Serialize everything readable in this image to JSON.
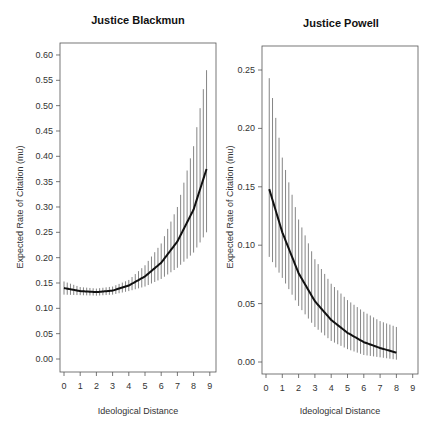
{
  "chart_data": [
    {
      "type": "line",
      "title": "Justice Blackmun",
      "xlabel": "Ideological Distance",
      "ylabel": "Expected Rate of Citation (mu)",
      "xlim": [
        0,
        9
      ],
      "ylim": [
        0.0,
        0.6
      ],
      "xticks": [
        0,
        1,
        2,
        3,
        4,
        5,
        6,
        7,
        8,
        9
      ],
      "yticks": [
        "0.00",
        "0.05",
        "0.10",
        "0.15",
        "0.20",
        "0.25",
        "0.30",
        "0.35",
        "0.40",
        "0.45",
        "0.50",
        "0.55",
        "0.60"
      ],
      "grid": false,
      "series": [
        {
          "name": "mean",
          "x": [
            0,
            1,
            2,
            3,
            4,
            5,
            6,
            7,
            8,
            8.8
          ],
          "values": [
            0.14,
            0.134,
            0.132,
            0.135,
            0.145,
            0.163,
            0.19,
            0.232,
            0.295,
            0.375
          ]
        },
        {
          "name": "upper",
          "x": [
            0,
            1,
            2,
            3,
            4,
            5,
            6,
            7,
            8,
            8.8
          ],
          "values": [
            0.153,
            0.142,
            0.139,
            0.143,
            0.156,
            0.185,
            0.228,
            0.3,
            0.42,
            0.57
          ]
        },
        {
          "name": "lower",
          "x": [
            0,
            1,
            2,
            3,
            4,
            5,
            6,
            7,
            8,
            8.8
          ],
          "values": [
            0.127,
            0.126,
            0.125,
            0.127,
            0.134,
            0.143,
            0.158,
            0.18,
            0.21,
            0.25
          ]
        }
      ],
      "interval_step": 0.2
    },
    {
      "type": "line",
      "title": "Justice Powell",
      "xlabel": "Ideological Distance",
      "ylabel": "Expected Rate of Citation (mu)",
      "xlim": [
        0,
        9
      ],
      "ylim": [
        0.0,
        0.25
      ],
      "xticks": [
        0,
        1,
        2,
        3,
        4,
        5,
        6,
        7,
        8,
        9
      ],
      "yticks": [
        "0.00",
        "0.05",
        "0.10",
        "0.15",
        "0.20",
        "0.25"
      ],
      "grid": false,
      "series": [
        {
          "name": "mean",
          "x": [
            0.2,
            1,
            2,
            3,
            4,
            5,
            6,
            7,
            8
          ],
          "values": [
            0.148,
            0.111,
            0.076,
            0.052,
            0.036,
            0.025,
            0.017,
            0.012,
            0.008
          ]
        },
        {
          "name": "upper",
          "x": [
            0.2,
            1,
            2,
            3,
            4,
            5,
            6,
            7,
            8
          ],
          "values": [
            0.243,
            0.175,
            0.122,
            0.088,
            0.067,
            0.053,
            0.043,
            0.035,
            0.03
          ]
        },
        {
          "name": "lower",
          "x": [
            0.2,
            1,
            2,
            3,
            4,
            5,
            6,
            7,
            8
          ],
          "values": [
            0.09,
            0.072,
            0.048,
            0.03,
            0.018,
            0.011,
            0.006,
            0.004,
            0.002
          ]
        }
      ],
      "interval_step": 0.2
    }
  ],
  "panels": [
    {
      "title": "Justice Blackmun",
      "xlabel": "Ideological Distance",
      "ylabel": "Expected Rate of Citation (mu)"
    },
    {
      "title": "Justice Powell",
      "xlabel": "Ideological Distance",
      "ylabel": "Expected Rate of Citation (mu)"
    }
  ],
  "colors": {
    "mean_line": "#111111",
    "interval": "#777777",
    "axis": "#555555"
  }
}
